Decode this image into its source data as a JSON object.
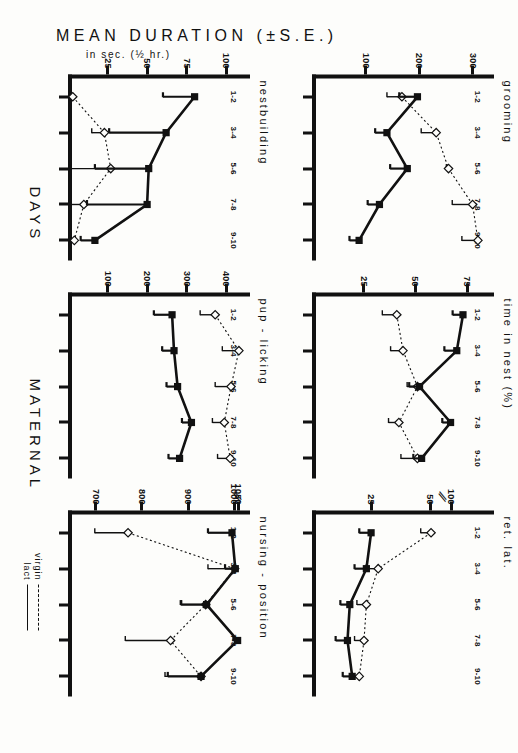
{
  "figure": {
    "axis_caption_group": "MATERNAL",
    "axis_caption_x": "DAYS",
    "ylabel_main": "MEAN DURATION (±S.E.)",
    "ylabel_sub": "in sec. (½ hr.)",
    "legend": {
      "virgin_label": "virgin",
      "virgin_style": "dashed",
      "lact_label": "lact",
      "lact_style": "solid"
    },
    "xcategories": [
      "1-2",
      "3-4",
      "5-6",
      "7-8",
      "9-10"
    ],
    "colors": {
      "ink": "#111111",
      "paper": "#fdfdfb"
    }
  },
  "chart_data": [
    {
      "id": "grooming",
      "type": "line",
      "title": "grooming",
      "xlabel": "DAYS",
      "ylabel": "MEAN DURATION (±S.E.) in sec. (½ hr.)",
      "categories": [
        "1-2",
        "3-4",
        "5-6",
        "7-8",
        "9-10"
      ],
      "yticks": [
        100,
        200,
        300
      ],
      "ylim": [
        0,
        340
      ],
      "axis_break": false,
      "grid": false,
      "series": [
        {
          "name": "virgin",
          "style": "dashed",
          "marker": "open-diamond",
          "values": [
            168,
            232,
            255,
            300,
            310
          ],
          "errors": [
            28,
            28,
            4,
            38,
            30
          ]
        },
        {
          "name": "lact",
          "style": "solid",
          "marker": "filled-square",
          "values": [
            197,
            140,
            178,
            126,
            88
          ],
          "errors": [
            34,
            22,
            32,
            22,
            18
          ]
        }
      ]
    },
    {
      "id": "time-in-nest",
      "type": "line",
      "title": "time in nest (%)",
      "xlabel": "DAYS",
      "ylabel": "MEAN DURATION (±S.E.) in sec. (½ hr.)",
      "categories": [
        "1-2",
        "3-4",
        "5-6",
        "7-8",
        "9-10"
      ],
      "yticks": [
        25,
        50,
        75
      ],
      "ylim": [
        0,
        88
      ],
      "axis_break": false,
      "grid": false,
      "series": [
        {
          "name": "virgin",
          "style": "dashed",
          "marker": "open-diamond",
          "values": [
            41,
            44,
            51,
            42,
            51
          ],
          "errors": [
            7,
            6,
            5,
            5,
            8
          ]
        },
        {
          "name": "lact",
          "style": "solid",
          "marker": "filled-square",
          "values": [
            73,
            70,
            52,
            67,
            53
          ],
          "errors": [
            5,
            6,
            5,
            4,
            4
          ]
        }
      ]
    },
    {
      "id": "ret-lat",
      "type": "line",
      "title": "ret. lat.",
      "xlabel": "DAYS",
      "ylabel": "MEAN DURATION (±S.E.) in sec. (½ hr.)",
      "categories": [
        "1-2",
        "3-4",
        "5-6",
        "7-8",
        "9-10"
      ],
      "yticks": [
        25,
        50,
        100
      ],
      "ylim": [
        0,
        118
      ],
      "axis_break": true,
      "axis_break_between": [
        50,
        100
      ],
      "grid": false,
      "series": [
        {
          "name": "virgin",
          "style": "dashed",
          "marker": "open-diamond",
          "values": [
            52,
            28,
            23,
            22,
            20
          ],
          "errors": [
            6,
            5,
            4,
            4,
            3
          ]
        },
        {
          "name": "lact",
          "style": "solid",
          "marker": "filled-square",
          "values": [
            25,
            23,
            16,
            15,
            17
          ],
          "errors": [
            5,
            5,
            4,
            5,
            4
          ]
        }
      ]
    },
    {
      "id": "nestbuilding",
      "type": "line",
      "title": "nestbuilding",
      "xlabel": "DAYS",
      "ylabel": "MEAN DURATION (±S.E.) in sec. (½ hr.)",
      "categories": [
        "1-2",
        "3-4",
        "5-6",
        "7-8",
        "9-10"
      ],
      "yticks": [
        25,
        50,
        75,
        100
      ],
      "ylim": [
        0,
        115
      ],
      "axis_break": false,
      "grid": false,
      "series": [
        {
          "name": "virgin",
          "style": "dashed",
          "marker": "open-diamond",
          "values": [
            3,
            23,
            27,
            10,
            4
          ],
          "errors": [
            2,
            8,
            26,
            8,
            3
          ]
        },
        {
          "name": "lact",
          "style": "solid",
          "marker": "filled-square",
          "values": [
            80,
            62,
            51,
            50,
            17
          ],
          "errors": [
            20,
            36,
            34,
            38,
            9
          ]
        }
      ]
    },
    {
      "id": "pup-licking",
      "type": "line",
      "title": "pup - licking",
      "xlabel": "DAYS",
      "ylabel": "MEAN DURATION (±S.E.) in sec. (½ hr.)",
      "categories": [
        "1-2",
        "3-4",
        "5-6",
        "7-8",
        "9-10"
      ],
      "yticks": [
        100,
        200,
        300,
        400
      ],
      "ylim": [
        0,
        460
      ],
      "axis_break": false,
      "grid": false,
      "series": [
        {
          "name": "virgin",
          "style": "dashed",
          "marker": "open-diamond",
          "values": [
            372,
            432,
            412,
            395,
            410
          ],
          "errors": [
            38,
            42,
            40,
            30,
            32
          ]
        },
        {
          "name": "lact",
          "style": "solid",
          "marker": "filled-square",
          "values": [
            263,
            268,
            277,
            312,
            282
          ],
          "errors": [
            46,
            30,
            28,
            24,
            28
          ]
        }
      ]
    },
    {
      "id": "nursing-position",
      "type": "line",
      "title": "nursing - position",
      "xlabel": "DAYS",
      "ylabel": "MEAN DURATION (±S.E.) in sec. (½ hr.)",
      "categories": [
        "1-2",
        "3-4",
        "5-6",
        "7-8",
        "9-10"
      ],
      "yticks": [
        700,
        800,
        900,
        1000,
        1050
      ],
      "ylim": [
        640,
        1075
      ],
      "axis_break": true,
      "axis_break_between": [
        1000,
        1050
      ],
      "grid": false,
      "series": [
        {
          "name": "virgin",
          "style": "dashed",
          "marker": "open-diamond",
          "values": [
            770,
            1005,
            938,
            862,
            928
          ],
          "errors": [
            72,
            62,
            52,
            98,
            78
          ]
        },
        {
          "name": "lact",
          "style": "solid",
          "marker": "filled-square",
          "values": [
            995,
            1012,
            940,
            1040,
            928
          ],
          "errors": [
            52,
            32,
            56,
            42,
            72
          ]
        }
      ]
    }
  ]
}
